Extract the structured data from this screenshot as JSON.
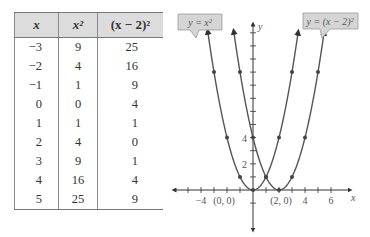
{
  "table": {
    "headers": [
      "x",
      "x²",
      "(x − 2)²"
    ],
    "rows": [
      [
        "−3",
        "9",
        "25"
      ],
      [
        "−2",
        "4",
        "16"
      ],
      [
        "−1",
        "1",
        "9"
      ],
      [
        "0",
        "0",
        "4"
      ],
      [
        "1",
        "1",
        "1"
      ],
      [
        "2",
        "4",
        "0"
      ],
      [
        "3",
        "9",
        "1"
      ],
      [
        "4",
        "16",
        "4"
      ],
      [
        "5",
        "25",
        "9"
      ]
    ]
  },
  "graph": {
    "callout_left": "y = x²",
    "callout_right": "y = (x − 2)²",
    "x_axis_label": "x",
    "y_axis_label": "y",
    "x_tick_labels": [
      "−4",
      "4",
      "6"
    ],
    "y_tick_labels": [
      "2",
      "4"
    ],
    "point_labels": [
      "(0, 0)",
      "(2, 0)"
    ]
  },
  "chart_data": {
    "type": "line",
    "title": "",
    "xlabel": "x",
    "ylabel": "y",
    "xlim": [
      -5,
      7
    ],
    "ylim": [
      -2,
      12
    ],
    "grid": false,
    "series": [
      {
        "name": "y = x²",
        "x": [
          -3,
          -2,
          -1,
          0,
          1,
          2,
          3
        ],
        "values": [
          9,
          4,
          1,
          0,
          1,
          4,
          9
        ]
      },
      {
        "name": "y = (x − 2)²",
        "x": [
          -1,
          0,
          1,
          2,
          3,
          4,
          5
        ],
        "values": [
          9,
          4,
          1,
          0,
          1,
          4,
          9
        ]
      }
    ],
    "annotations": [
      "(0, 0)",
      "(2, 0)"
    ],
    "table": {
      "columns": [
        "x",
        "x²",
        "(x − 2)²"
      ],
      "rows": [
        [
          -3,
          9,
          25
        ],
        [
          -2,
          4,
          16
        ],
        [
          -1,
          1,
          9
        ],
        [
          0,
          0,
          4
        ],
        [
          1,
          1,
          1
        ],
        [
          2,
          4,
          0
        ],
        [
          3,
          9,
          1
        ],
        [
          4,
          16,
          4
        ],
        [
          5,
          25,
          9
        ]
      ]
    }
  }
}
